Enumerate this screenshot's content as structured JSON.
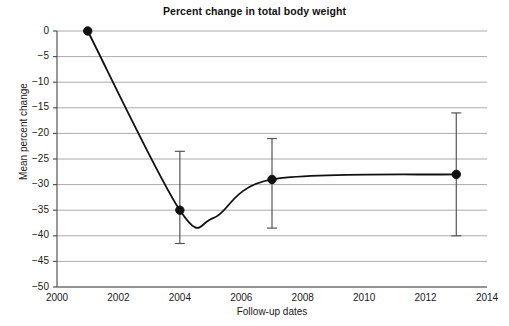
{
  "chart_data": {
    "type": "line",
    "title": "Percent change in total body weight",
    "xlabel": "Follow-up dates",
    "ylabel": "Mean percent change",
    "grid": true,
    "legend": "none",
    "xlim": [
      2000,
      2014
    ],
    "ylim": [
      -50,
      0
    ],
    "xticks": [
      2000,
      2002,
      2004,
      2006,
      2008,
      2010,
      2012,
      2014
    ],
    "xtick_labels": [
      "2000",
      "2002",
      "2004",
      "2006",
      "2008",
      "2010",
      "2012",
      "2014"
    ],
    "yticks": [
      0,
      -5,
      -10,
      -15,
      -20,
      -25,
      -30,
      -35,
      -40,
      -45,
      -50
    ],
    "ytick_labels": [
      "0",
      "−5",
      "−10",
      "−15",
      "−20",
      "−25",
      "−30",
      "−35",
      "−40",
      "−45",
      "−50"
    ],
    "x": [
      2001,
      2004,
      2007,
      2013
    ],
    "values": [
      0,
      -35,
      -29,
      -28
    ],
    "error_low": [
      0,
      -41.5,
      -38.5,
      -40
    ],
    "error_high": [
      0,
      -23.5,
      -21,
      -16
    ],
    "has_error_bars": [
      false,
      true,
      true,
      true
    ],
    "curve_minimum": {
      "x": 2005.1,
      "y": -36.5
    },
    "interpolation": "smooth-spline",
    "marker": "filled-circle",
    "colors": {
      "line": "#111111",
      "marker": "#111111",
      "errorbar": "#555555",
      "grid": "#aaaaaa",
      "axis": "#555555",
      "background": "#ffffff",
      "text": "#1a1a1a"
    }
  }
}
